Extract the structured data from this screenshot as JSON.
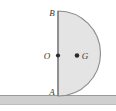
{
  "figure": {
    "background_color": "#ffffff",
    "labels": {
      "top_point": "B",
      "center_point": "O",
      "centroid_point": "G",
      "bottom_point": "A"
    },
    "shape": {
      "name": "semicircular-lamina",
      "fill_color": "#e4e4e4",
      "stroke_color": "#8c8c8c",
      "diameter_x": 58,
      "top_y": 11,
      "bottom_y": 96,
      "radius": 42.5,
      "rightmost_x": 100
    },
    "points": [
      {
        "id": "B",
        "label": "B",
        "x": 58,
        "y": 11,
        "dot": false,
        "label_x": 49,
        "label_y": 16
      },
      {
        "id": "O",
        "label": "O",
        "x": 58,
        "y": 55.5,
        "dot": true,
        "label_x": 44,
        "label_y": 59
      },
      {
        "id": "G",
        "label": "G",
        "x": 77,
        "y": 55.5,
        "dot": true,
        "label_x": 82,
        "label_y": 59
      },
      {
        "id": "A",
        "label": "A",
        "x": 58,
        "y": 96,
        "dot": false,
        "label_x": 49,
        "label_y": 95
      }
    ],
    "ground": {
      "name": "hatched-ground-band",
      "fill_color": "#cfcfcf",
      "line_color": "#9a9a9a",
      "top_y": 95,
      "bottom_y": 105,
      "x_start": 0,
      "x_end": 116
    },
    "dot": {
      "color": "#2c2c2c",
      "radius": 2.1
    }
  }
}
